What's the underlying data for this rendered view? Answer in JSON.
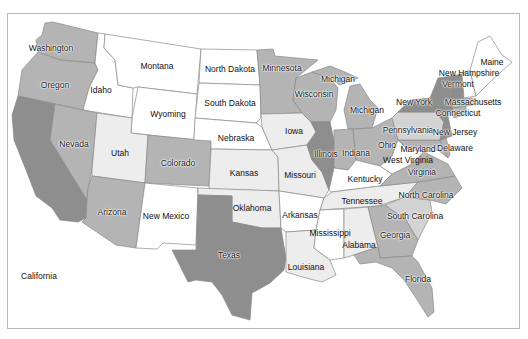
{
  "map": {
    "title": "",
    "type": "choropleth",
    "region": "United States",
    "shade_scale": {
      "0": "#ffffff",
      "1": "#ededed",
      "2": "#d3d3d3",
      "3": "#b4b4b4",
      "4": "#8e8e8e"
    },
    "states": [
      {
        "name": "Washington",
        "shade": 3,
        "label_xy": [
          51,
          48
        ]
      },
      {
        "name": "Oregon",
        "shade": 3,
        "label_xy": [
          55,
          85
        ]
      },
      {
        "name": "California",
        "shade": 4,
        "label_xy": [
          39,
          276
        ]
      },
      {
        "name": "Idaho",
        "shade": 0,
        "label_xy": [
          101,
          90
        ]
      },
      {
        "name": "Nevada",
        "shade": 3,
        "label_xy": [
          74,
          144
        ]
      },
      {
        "name": "Montana",
        "shade": 0,
        "label_xy": [
          157,
          66
        ]
      },
      {
        "name": "Wyoming",
        "shade": 0,
        "label_xy": [
          168,
          114
        ]
      },
      {
        "name": "Utah",
        "shade": 1,
        "label_xy": [
          120,
          153
        ]
      },
      {
        "name": "Arizona",
        "shade": 3,
        "label_xy": [
          112,
          212
        ]
      },
      {
        "name": "Colorado",
        "shade": 3,
        "label_xy": [
          178,
          163
        ]
      },
      {
        "name": "New Mexico",
        "shade": 0,
        "label_xy": [
          166,
          216
        ]
      },
      {
        "name": "North Dakota",
        "shade": 0,
        "label_xy": [
          230,
          69
        ]
      },
      {
        "name": "South Dakota",
        "shade": 0,
        "label_xy": [
          230,
          103
        ]
      },
      {
        "name": "Nebraska",
        "shade": 0,
        "label_xy": [
          236,
          138
        ]
      },
      {
        "name": "Kansas",
        "shade": 1,
        "label_xy": [
          244,
          173
        ]
      },
      {
        "name": "Oklahoma",
        "shade": 1,
        "label_xy": [
          252,
          208
        ]
      },
      {
        "name": "Texas",
        "shade": 4,
        "label_xy": [
          229,
          255
        ]
      },
      {
        "name": "Minnesota",
        "shade": 3,
        "label_xy": [
          282,
          68
        ]
      },
      {
        "name": "Iowa",
        "shade": 1,
        "label_xy": [
          294,
          131
        ]
      },
      {
        "name": "Missouri",
        "shade": 1,
        "label_xy": [
          300,
          175
        ]
      },
      {
        "name": "Arkansas",
        "shade": 0,
        "label_xy": [
          300,
          215
        ]
      },
      {
        "name": "Louisiana",
        "shade": 1,
        "label_xy": [
          306,
          267
        ]
      },
      {
        "name": "Wisconsin",
        "shade": 3,
        "label_xy": [
          314,
          94
        ]
      },
      {
        "name": "Illinois",
        "shade": 4,
        "label_xy": [
          326,
          154
        ]
      },
      {
        "name": "Michigan",
        "shade": 3,
        "label_xy": [
          338,
          79
        ],
        "note": "Upper Peninsula label"
      },
      {
        "name": "Michigan",
        "shade": 3,
        "label_xy": [
          367,
          110
        ],
        "note": "Lower Peninsula label"
      },
      {
        "name": "Indiana",
        "shade": 3,
        "label_xy": [
          356,
          153
        ]
      },
      {
        "name": "Ohio",
        "shade": 3,
        "label_xy": [
          387,
          145
        ]
      },
      {
        "name": "Kentucky",
        "shade": 0,
        "label_xy": [
          365,
          179
        ]
      },
      {
        "name": "Tennessee",
        "shade": 1,
        "label_xy": [
          362,
          201
        ]
      },
      {
        "name": "Mississippi",
        "shade": 0,
        "label_xy": [
          330,
          233
        ]
      },
      {
        "name": "Alabama",
        "shade": 1,
        "label_xy": [
          359,
          245
        ]
      },
      {
        "name": "Georgia",
        "shade": 3,
        "label_xy": [
          395,
          235
        ]
      },
      {
        "name": "Florida",
        "shade": 3,
        "label_xy": [
          418,
          279
        ]
      },
      {
        "name": "South Carolina",
        "shade": 2,
        "label_xy": [
          415,
          216
        ]
      },
      {
        "name": "North Carolina",
        "shade": 3,
        "label_xy": [
          426,
          195
        ]
      },
      {
        "name": "Virginia",
        "shade": 3,
        "label_xy": [
          422,
          172
        ]
      },
      {
        "name": "West Virginia",
        "shade": 0,
        "label_xy": [
          408,
          160
        ]
      },
      {
        "name": "Maryland",
        "shade": 3,
        "label_xy": [
          418,
          149
        ]
      },
      {
        "name": "Delaware",
        "shade": 3,
        "label_xy": [
          455,
          148
        ]
      },
      {
        "name": "Pennsylvania",
        "shade": 2,
        "label_xy": [
          408,
          130
        ]
      },
      {
        "name": "New Jersey",
        "shade": 4,
        "label_xy": [
          455,
          132
        ]
      },
      {
        "name": "New York",
        "shade": 4,
        "label_xy": [
          414,
          102
        ]
      },
      {
        "name": "Connecticut",
        "shade": 3,
        "label_xy": [
          458,
          113
        ]
      },
      {
        "name": "Massachusetts",
        "shade": 3,
        "label_xy": [
          473,
          102
        ]
      },
      {
        "name": "Vermont",
        "shade": 4,
        "label_xy": [
          458,
          84
        ]
      },
      {
        "name": "New Hampshire",
        "shade": 0,
        "label_xy": [
          469,
          73
        ]
      },
      {
        "name": "Maine",
        "shade": 0,
        "label_xy": [
          492,
          62
        ]
      }
    ]
  }
}
